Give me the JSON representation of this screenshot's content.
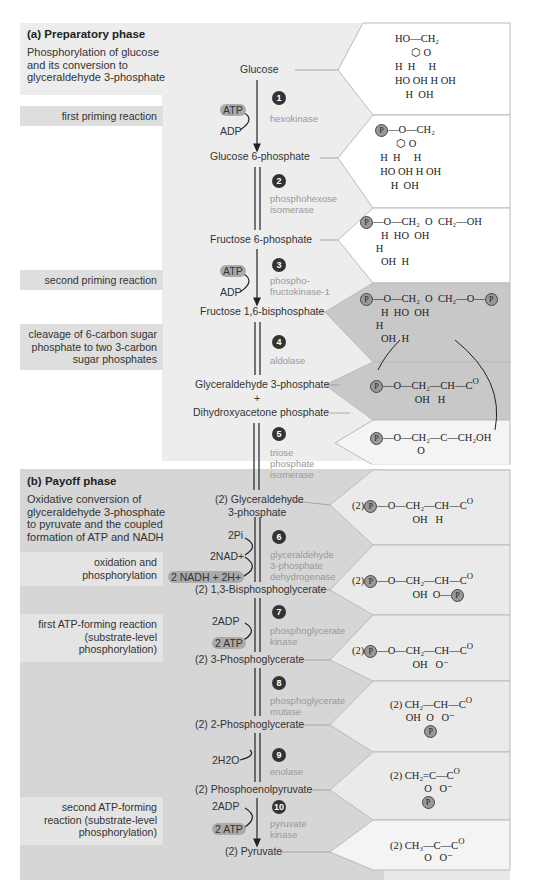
{
  "phase_a": {
    "title": "(a) Preparatory phase",
    "description": "Phosphorylation of glucose and its conversion to glyceraldehyde 3-phosphate"
  },
  "phase_b": {
    "title": "(b) Payoff phase",
    "description": "Oxidative conversion of glyceraldehyde 3-phosphate to pyruvate and the coupled formation of ATP and NADH"
  },
  "side_labels": [
    {
      "text": "first priming reaction"
    },
    {
      "text": "second priming reaction"
    },
    {
      "text": "cleavage of 6-carbon sugar phosphate to two 3-carbon sugar phosphates"
    },
    {
      "text": "oxidation and phosphorylation"
    },
    {
      "text": "first ATP-forming reaction (substrate-level phosphorylation)"
    },
    {
      "text": "second ATP-forming reaction (substrate-level phosphorylation)"
    }
  ],
  "compounds": [
    "Glucose",
    "Glucose 6-phosphate",
    "Fructose 6-phosphate",
    "Fructose 1,6-bisphosphate",
    "Glyceraldehyde 3-phosphate",
    "+",
    "Dihydroxyacetone phosphate",
    "(2) Glyceraldehyde",
    "3-phosphate",
    "(2) 1,3-Bisphosphoglycerate",
    "(2) 3-Phosphoglycerate",
    "(2) 2-Phosphoglycerate",
    "(2) Phosphoenolpyruvate",
    "(2) Pyruvate"
  ],
  "steps": [
    {
      "num": "1",
      "enzyme": "hexokinase"
    },
    {
      "num": "2",
      "enzyme": "phosphohexose isomerase"
    },
    {
      "num": "3",
      "enzyme": "phospho- fructokinase-1"
    },
    {
      "num": "4",
      "enzyme": "aldolase"
    },
    {
      "num": "5",
      "enzyme": "triose phosphate isomerase"
    },
    {
      "num": "6",
      "enzyme": "glyceraldehyde 3-phosphate dehydrogenase"
    },
    {
      "num": "7",
      "enzyme": "phosphoglycerate kinase"
    },
    {
      "num": "8",
      "enzyme": "phosphoglycerate mutase"
    },
    {
      "num": "9",
      "enzyme": "enolase"
    },
    {
      "num": "10",
      "enzyme": "pyruvate kinase"
    }
  ],
  "cofactors": {
    "atp1": "ATP",
    "adp1": "ADP",
    "atp3": "ATP",
    "adp3": "ADP",
    "pi6": "2Pi",
    "nad6": "2NAD+",
    "nadh6": "2 NADH + 2H+",
    "adp7": "2ADP",
    "atp7": "2 ATP",
    "h2o9": "2H2O",
    "adp10": "2ADP",
    "atp10": "2 ATP"
  },
  "structures": {
    "glyceraldehyde_3p": "P—O—CH2—CH—C(=O)H, OH",
    "dhap": "P—O—CH2—C(=O)—CH2OH",
    "g3p_2": "(2) P—O—CH2—CH(OH)—CHO",
    "bpg": "(2) P—O—CH2—CH(OH)—C(=O)—O—P",
    "pg3": "(2) P—O—CH2—CH(OH)—COO−",
    "pg2": "(2) CH2(OH)—CH(O—P)—COO−",
    "pep": "(2) CH2=C(O—P)—COO−",
    "pyruvate": "(2) CH3—C(=O)—COO−"
  },
  "colors": {
    "panel_a": "#ededed",
    "panel_b": "#d6d6d6",
    "label_box": "#dedede",
    "highlight": "#c4c4c4",
    "pill": "#aaaaaa",
    "enzyme_text": "#999999",
    "step_circle": "#333333"
  }
}
